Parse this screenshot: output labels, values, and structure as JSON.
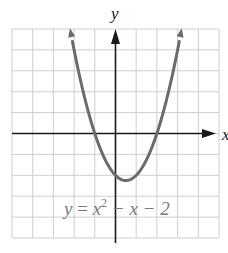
{
  "chart_data": {
    "type": "line",
    "title": "",
    "xlabel": "x",
    "ylabel": "y",
    "xlim": [
      -5,
      5
    ],
    "ylim": [
      -5,
      5
    ],
    "grid": true,
    "grid_step": 1,
    "tick_labels": "none",
    "legend": "none",
    "series": [
      {
        "name": "y = x² − x − 2",
        "function": "x^2 - x - 2",
        "x": [
          -2.2,
          -2,
          -1.5,
          -1,
          -0.5,
          0,
          0.5,
          1,
          1.5,
          2,
          2.5,
          3,
          3.2
        ],
        "y": [
          5.04,
          4,
          1.75,
          0,
          -1.25,
          -2,
          -2.25,
          -2,
          -1.25,
          0,
          1.75,
          4,
          5.04
        ],
        "arrows_at_ends": true,
        "color": "#6b6b6b"
      }
    ],
    "annotations": [
      {
        "text": "y = x² − x − 2",
        "x": -2.5,
        "y": -3.8
      }
    ],
    "key_points": {
      "x_intercepts": [
        -1,
        2
      ],
      "y_intercept": -2,
      "vertex": [
        0.5,
        -2.25
      ]
    }
  },
  "labels": {
    "x_axis": "x",
    "y_axis": "y",
    "equation_y": "y",
    "equation_eq": " = ",
    "equation_x": "x",
    "equation_exp": "2",
    "equation_rest": " − x − 2"
  },
  "colors": {
    "grid": "#cfcfcf",
    "axes": "#1a1a1a",
    "curve": "#6b6b6b",
    "equation": "#7a7a7a"
  }
}
